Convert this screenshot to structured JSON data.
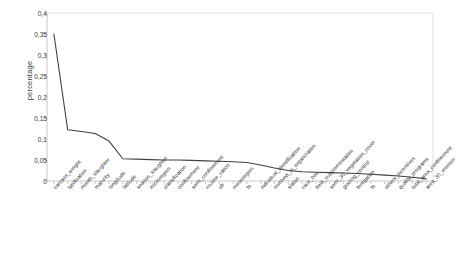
{
  "chart_data": {
    "type": "line",
    "title": "",
    "xlabel": "",
    "ylabel": "percentage",
    "ylim": [
      0,
      0.4
    ],
    "ytick_values": [
      0,
      0.05,
      0.1,
      0.15,
      0.2,
      0.25,
      0.3,
      0.35,
      0.4
    ],
    "ytick_labels": [
      "0",
      "0,05",
      "0,1",
      "0,15",
      "0,2",
      "0,25",
      "0,3",
      "0,35",
      "0,4"
    ],
    "decimal_separator": ",",
    "grid": false,
    "legend": "none",
    "line_color": "#404040",
    "axis_color": "#c8c8c8",
    "categories": [
      "carcass_weight",
      "typification",
      "month_slaughter",
      "maturity",
      "longitude",
      "latitude",
      "season_slaughter",
      "microregion",
      "classification",
      "confinement",
      "semi_confinement",
      "routine_ration",
      "cfr",
      "mesoregion",
      "fs",
      "individual_identification",
      "involved_in_organization",
      "slaton",
      "race_bos",
      "field_supplementation",
      "semi_30_vegetation_cover",
      "grazing_control",
      "fertigation",
      "fs2",
      "others_incentives",
      "quality_programs",
      "total_area_confinement",
      "area_30_erosion"
    ],
    "values": [
      0.35,
      0.122,
      0.118,
      0.113,
      0.095,
      0.053,
      0.052,
      0.051,
      0.05,
      0.05,
      0.049,
      0.048,
      0.047,
      0.046,
      0.044,
      0.038,
      0.031,
      0.025,
      0.022,
      0.021,
      0.02,
      0.019,
      0.018,
      0.016,
      0.014,
      0.012,
      0.009,
      0.005
    ]
  }
}
